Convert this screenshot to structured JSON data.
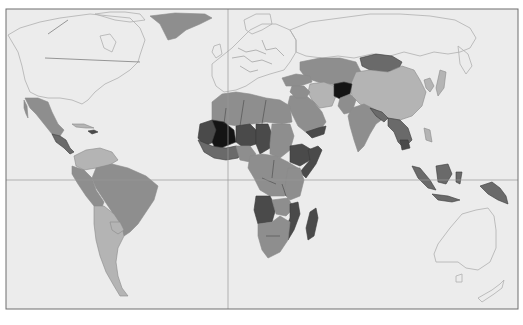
{
  "map": {
    "type": "choropleth-world-map",
    "palette": {
      "ocean": "#ececec",
      "frame": "#6e6e6e",
      "grid_line": "#9a9a9a",
      "tier_0_no_data_or_lowest": "#e2e2e2",
      "tier_1_low": "#b4b4b4",
      "tier_2_medium": "#8e8e8e",
      "tier_3_high": "#6a6a6a",
      "tier_4_very_high": "#4a4a4a",
      "tier_5_highest": "#141414"
    },
    "lines": {
      "equator": true,
      "prime_meridian": true
    },
    "regions": [
      {
        "name": "North America (Canada, USA)",
        "tier": 0
      },
      {
        "name": "Greenland",
        "tier": 2
      },
      {
        "name": "Mexico",
        "tier": 2
      },
      {
        "name": "Central America",
        "tier": 3
      },
      {
        "name": "Caribbean (Haiti)",
        "tier": 4
      },
      {
        "name": "South America (north)",
        "tier": 2
      },
      {
        "name": "Brazil",
        "tier": 2
      },
      {
        "name": "Argentina / Chile",
        "tier": 1
      },
      {
        "name": "Europe",
        "tier": 0
      },
      {
        "name": "Russia",
        "tier": 0
      },
      {
        "name": "North Africa",
        "tier": 2
      },
      {
        "name": "West Africa (Mali, Niger region)",
        "tier": 5
      },
      {
        "name": "Sahel",
        "tier": 4
      },
      {
        "name": "Central Africa",
        "tier": 2
      },
      {
        "name": "Ethiopia / Somalia",
        "tier": 4
      },
      {
        "name": "Southern Africa",
        "tier": 2
      },
      {
        "name": "Angola",
        "tier": 4
      },
      {
        "name": "Mozambique",
        "tier": 4
      },
      {
        "name": "Madagascar",
        "tier": 4
      },
      {
        "name": "Middle East",
        "tier": 2
      },
      {
        "name": "Yemen",
        "tier": 4
      },
      {
        "name": "Afghanistan",
        "tier": 5
      },
      {
        "name": "Central Asia",
        "tier": 2
      },
      {
        "name": "Mongolia",
        "tier": 3
      },
      {
        "name": "China",
        "tier": 1
      },
      {
        "name": "India",
        "tier": 2
      },
      {
        "name": "Southeast Asia",
        "tier": 3
      },
      {
        "name": "Indonesia",
        "tier": 3
      },
      {
        "name": "Australia",
        "tier": 0
      },
      {
        "name": "New Zealand",
        "tier": 0
      }
    ]
  }
}
